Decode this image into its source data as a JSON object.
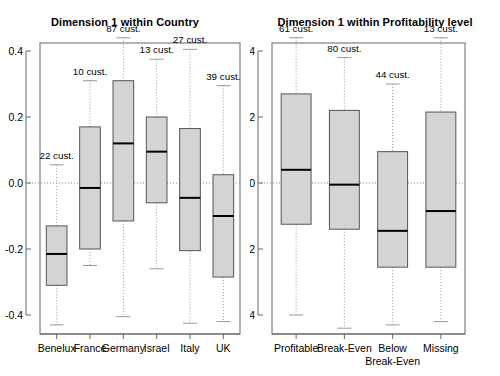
{
  "figure": {
    "width": 500,
    "height": 376,
    "background": "#ffffff",
    "box_fill": "#d4d4d4",
    "box_stroke": "#555555",
    "median_color": "#000000",
    "whisker_color": "#999999",
    "zero_line_color": "#888888",
    "frame_color": "#666666"
  },
  "chart_data": [
    {
      "type": "box",
      "panel_id": "country",
      "title": "Dimension 1 within Country",
      "xlabel": "",
      "ylabel": "",
      "ylim": [
        -0.47,
        0.47
      ],
      "yticks": [
        0.4,
        0.2,
        0.0,
        -0.2,
        -0.4
      ],
      "ytick_labels": [
        "0.4",
        "0.2",
        "0.0",
        "-0.2",
        "-0.4"
      ],
      "grid": false,
      "zero_reference_line": 0.0,
      "categories": [
        "Benelux",
        "France",
        "Germany",
        "Israel",
        "Italy",
        "UK"
      ],
      "annotation_suffix": "cust.",
      "boxes": [
        {
          "category": "Benelux",
          "count": 22,
          "annotation": "22 cust.",
          "q3": -0.13,
          "median": -0.215,
          "q1": -0.31,
          "upper_whisker": 0.055,
          "lower_whisker": -0.43
        },
        {
          "category": "France",
          "count": 10,
          "annotation": "10 cust.",
          "q3": 0.17,
          "median": -0.015,
          "q1": -0.2,
          "upper_whisker": 0.31,
          "lower_whisker": -0.25
        },
        {
          "category": "Germany",
          "count": 87,
          "annotation": "87 cust.",
          "q3": 0.31,
          "median": 0.12,
          "q1": -0.115,
          "upper_whisker": 0.44,
          "lower_whisker": -0.405
        },
        {
          "category": "Israel",
          "count": 13,
          "annotation": "13 cust.",
          "q3": 0.2,
          "median": 0.095,
          "q1": -0.06,
          "upper_whisker": 0.375,
          "lower_whisker": -0.26
        },
        {
          "category": "Italy",
          "count": 27,
          "annotation": "27 cust.",
          "q3": 0.165,
          "median": -0.045,
          "q1": -0.205,
          "upper_whisker": 0.405,
          "lower_whisker": -0.425
        },
        {
          "category": "UK",
          "count": 39,
          "annotation": "39 cust.",
          "q3": 0.025,
          "median": -0.1,
          "q1": -0.285,
          "upper_whisker": 0.295,
          "lower_whisker": -0.42
        }
      ]
    },
    {
      "type": "box",
      "panel_id": "profitability",
      "title": "Dimension 1 within Profitability level",
      "xlabel": "",
      "ylabel": "",
      "ylim": [
        -0.47,
        0.47
      ],
      "yticks": [
        0.4,
        0.2,
        0.0,
        -0.2,
        -0.4
      ],
      "ytick_labels": [
        "0.4",
        "0.2",
        "0.0",
        "-0.2",
        "-0.4"
      ],
      "grid": false,
      "zero_reference_line": 0.0,
      "categories": [
        "Profitable",
        "Break-Even",
        "Below Break-Even",
        "Missing"
      ],
      "annotation_suffix": "cust.",
      "boxes": [
        {
          "category": "Profitable",
          "count": 61,
          "annotation": "61 cust.",
          "q3": 0.27,
          "median": 0.04,
          "q1": -0.125,
          "upper_whisker": 0.44,
          "lower_whisker": -0.4
        },
        {
          "category": "Break-Even",
          "count": 80,
          "annotation": "80 cust.",
          "q3": 0.22,
          "median": -0.005,
          "q1": -0.14,
          "upper_whisker": 0.38,
          "lower_whisker": -0.44
        },
        {
          "category": "Below Break-Even",
          "count": 44,
          "annotation": "44 cust.",
          "q3": 0.095,
          "median": -0.145,
          "q1": -0.255,
          "upper_whisker": 0.3,
          "lower_whisker": -0.43
        },
        {
          "category": "Missing",
          "count": 13,
          "annotation": "13 cust.",
          "q3": 0.215,
          "median": -0.085,
          "q1": -0.255,
          "upper_whisker": 0.44,
          "lower_whisker": -0.42
        }
      ]
    }
  ],
  "panels": {
    "country": {
      "title": "Dimension 1 within Country",
      "ytick_labels": [
        "0.4",
        "0.2",
        "0.0",
        "-0.2",
        "-0.4"
      ],
      "xtick_labels": [
        "Benelux",
        "France",
        "Germany",
        "Israel",
        "Italy",
        "UK"
      ],
      "annotations": [
        "22 cust.",
        "10 cust.",
        "87 cust.",
        "13 cust.",
        "27 cust.",
        "39 cust."
      ]
    },
    "profitability": {
      "title": "Dimension 1 within Profitability level",
      "ytick_labels": [
        "0.4",
        "0.2",
        "0.0",
        "-0.2",
        "-0.4"
      ],
      "xtick_labels": [
        "Profitable",
        "Break-Even",
        "Below Break-Even",
        "Missing"
      ],
      "xtick_labels_wrapped": [
        [
          "Profitable"
        ],
        [
          "Break-Even"
        ],
        [
          "Below",
          "Break-Even"
        ],
        [
          "Missing"
        ]
      ],
      "annotations": [
        "61 cust.",
        "80 cust.",
        "44 cust.",
        "13 cust."
      ]
    }
  }
}
